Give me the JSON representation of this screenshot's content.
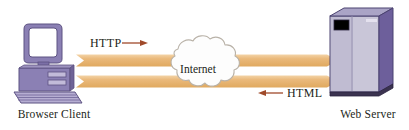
{
  "diagram": {
    "background": "#ffffff",
    "width": 409,
    "height": 130,
    "nodes": {
      "client": {
        "caption": "Browser Client",
        "icon": "desktop-computer-icon",
        "body_color": "#8b80b4",
        "shade_color": "#6f6397",
        "screen_color": "#ffffff",
        "outline_color": "#5d5282"
      },
      "server": {
        "caption": "Web Server",
        "icon": "server-tower-icon",
        "front_color": "#c9c6d8",
        "side_color": "#6d5f9b",
        "panel_color": "#b9b5cc",
        "display_color": "#000000",
        "outline_color": "#4b4270"
      },
      "cloud": {
        "label": "Internet",
        "icon": "cloud-icon",
        "fill_color": "#fdfdfd",
        "outline_color": "#b9b2a8"
      }
    },
    "flows": [
      {
        "id": "request",
        "protocol": "HTTP",
        "direction": "client-to-server",
        "band_color": "#e8b878",
        "arrow_color": "#a04a2a",
        "label_position": "above-left"
      },
      {
        "id": "response",
        "protocol": "HTML",
        "direction": "server-to-client",
        "band_color": "#e8b878",
        "arrow_color": "#a04a2a",
        "label_position": "below-right"
      }
    ]
  }
}
